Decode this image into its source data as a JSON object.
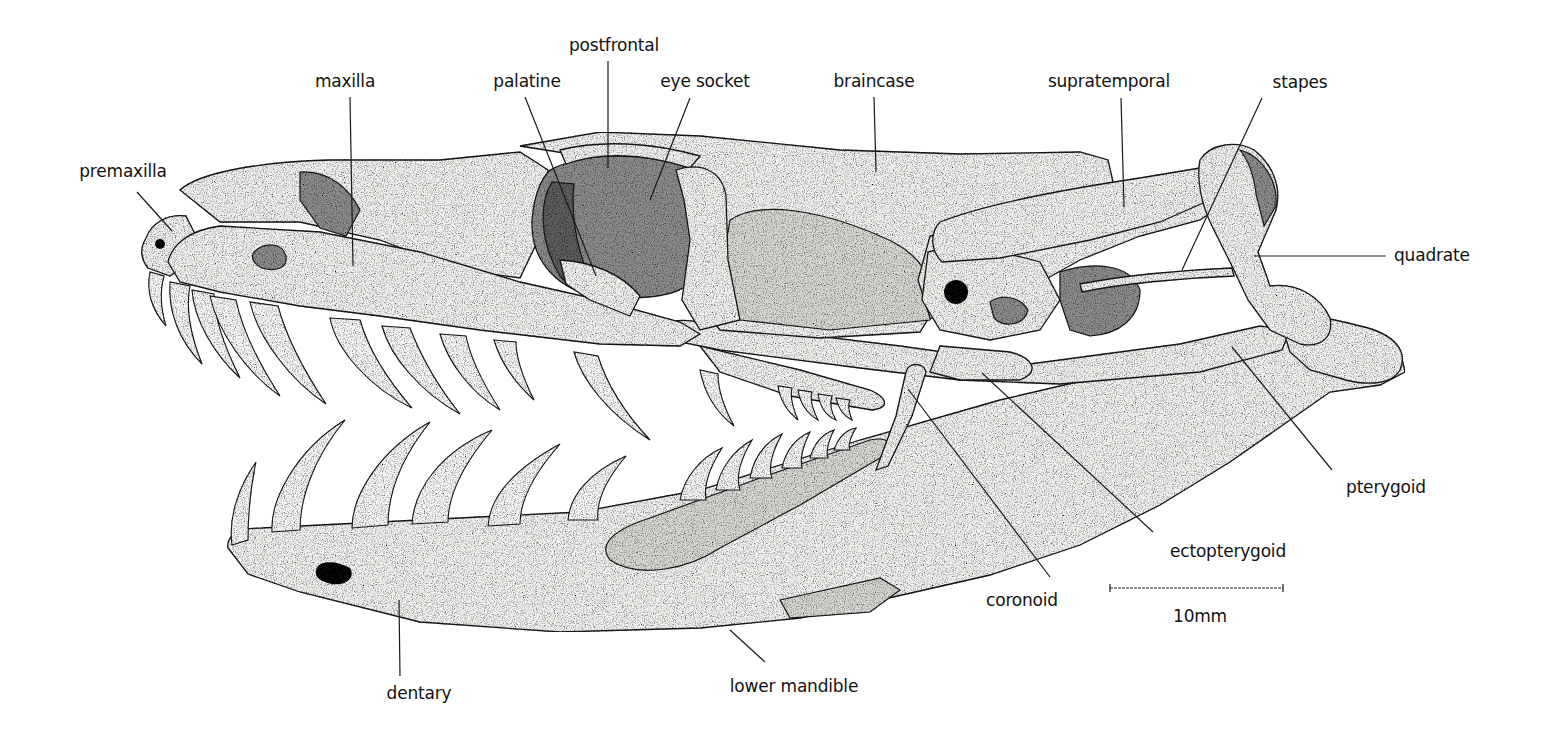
{
  "diagram": {
    "background": "#ffffff",
    "ink_color": "#111111",
    "labels": [
      {
        "id": "premaxilla",
        "text": "premaxilla",
        "x": 123,
        "y": 161,
        "anchor": [
          137,
          192
        ],
        "target": [
          172,
          231
        ]
      },
      {
        "id": "maxilla",
        "text": "maxilla",
        "x": 345,
        "y": 71,
        "anchor": [
          350,
          97
        ],
        "target": [
          353,
          266
        ]
      },
      {
        "id": "palatine",
        "text": "palatine",
        "x": 527,
        "y": 71,
        "anchor": [
          525,
          97
        ],
        "target": [
          596,
          276
        ]
      },
      {
        "id": "postfrontal",
        "text": "postfrontal",
        "x": 614,
        "y": 35,
        "anchor": [
          608,
          61
        ],
        "target": [
          608,
          168
        ]
      },
      {
        "id": "eye_socket",
        "text": "eye socket",
        "x": 705,
        "y": 71,
        "anchor": [
          690,
          98
        ],
        "target": [
          650,
          200
        ]
      },
      {
        "id": "braincase",
        "text": "braincase",
        "x": 874,
        "y": 71,
        "anchor": [
          874,
          97
        ],
        "target": [
          876,
          172
        ]
      },
      {
        "id": "supratemporal",
        "text": "supratemporal",
        "x": 1109,
        "y": 71,
        "anchor": [
          1121,
          98
        ],
        "target": [
          1124,
          207
        ]
      },
      {
        "id": "stapes",
        "text": "stapes",
        "x": 1300,
        "y": 72,
        "anchor": [
          1262,
          98
        ],
        "target": [
          1182,
          270
        ]
      },
      {
        "id": "quadrate",
        "text": "quadrate",
        "x": 1394,
        "y": 245,
        "anchor": [
          1386,
          256
        ],
        "target": [
          1254,
          256
        ],
        "align": "left"
      },
      {
        "id": "pterygoid",
        "text": "pterygoid",
        "x": 1386,
        "y": 477,
        "anchor": [
          1332,
          470
        ],
        "target": [
          1232,
          347
        ]
      },
      {
        "id": "ectopterygoid",
        "text": "ectopterygoid",
        "x": 1228,
        "y": 541,
        "anchor": [
          1153,
          532
        ],
        "target": [
          982,
          373
        ]
      },
      {
        "id": "coronoid",
        "text": "coronoid",
        "x": 1022,
        "y": 590,
        "anchor": [
          1050,
          577
        ],
        "target": [
          908,
          389
        ]
      },
      {
        "id": "dentary",
        "text": "dentary",
        "x": 419,
        "y": 683,
        "anchor": [
          400,
          676
        ],
        "target": [
          399,
          600
        ]
      },
      {
        "id": "lower_mandible",
        "text": "lower mandible",
        "x": 794,
        "y": 676,
        "anchor": [
          765,
          662
        ],
        "target": [
          730,
          630
        ]
      }
    ],
    "scale_bar": {
      "label": "10mm",
      "x1": 1110,
      "x2": 1283,
      "y": 588,
      "label_x": 1200,
      "label_y": 606
    }
  }
}
